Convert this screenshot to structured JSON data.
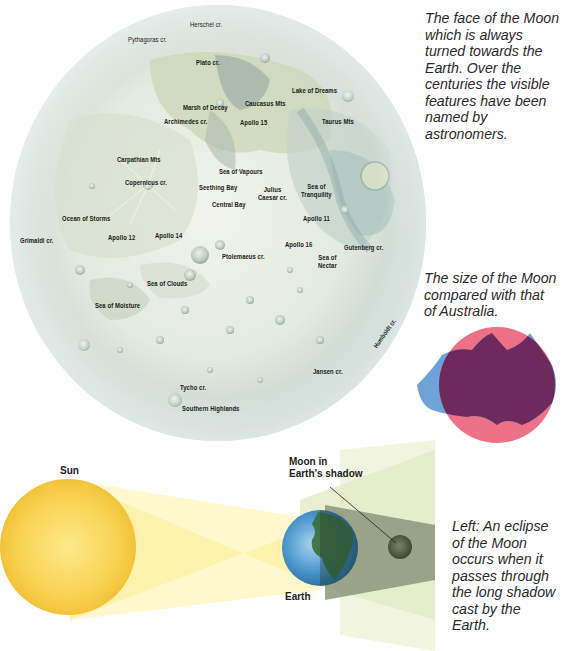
{
  "moon_map": {
    "labels": [
      {
        "id": "herschel",
        "text": "Herschel cr.",
        "x": 190,
        "y": 20
      },
      {
        "id": "pythagoras",
        "text": "Pythagoras cr.",
        "x": 128,
        "y": 35
      },
      {
        "id": "plato",
        "text": "Plato cr.",
        "x": 196,
        "y": 58
      },
      {
        "id": "lake-of-dreams",
        "text": "Lake of Dreams",
        "x": 292,
        "y": 86
      },
      {
        "id": "marsh-of-decay",
        "text": "Marsh of Decay",
        "x": 183,
        "y": 103
      },
      {
        "id": "caucasus-mts",
        "text": "Caucasus Mts",
        "x": 245,
        "y": 99
      },
      {
        "id": "archimedes",
        "text": "Archimedes cr.",
        "x": 164,
        "y": 117
      },
      {
        "id": "apollo-15",
        "text": "Apollo 15",
        "x": 240,
        "y": 118
      },
      {
        "id": "taurus-mts",
        "text": "Taurus Mts",
        "x": 322,
        "y": 117
      },
      {
        "id": "carpathian-mts",
        "text": "Carpathian Mts",
        "x": 117,
        "y": 155
      },
      {
        "id": "sea-of-vapours",
        "text": "Sea of Vapours",
        "x": 219,
        "y": 167
      },
      {
        "id": "copernicus",
        "text": "Copernicus cr.",
        "x": 125,
        "y": 178
      },
      {
        "id": "seething-bay",
        "text": "Seething Bay",
        "x": 199,
        "y": 183
      },
      {
        "id": "julius-caesar",
        "text": "Julius\nCaesar cr.",
        "x": 258,
        "y": 186
      },
      {
        "id": "sea-of-tranquility",
        "text": "Sea of\nTranquility",
        "x": 301,
        "y": 183
      },
      {
        "id": "central-bay",
        "text": "Central Bay",
        "x": 212,
        "y": 200
      },
      {
        "id": "ocean-of-storms",
        "text": "Ocean of Storms",
        "x": 62,
        "y": 214
      },
      {
        "id": "apollo-11",
        "text": "Apollo 11",
        "x": 303,
        "y": 214
      },
      {
        "id": "grimaldi",
        "text": "Grimaldi cr.",
        "x": 20,
        "y": 236
      },
      {
        "id": "apollo-12",
        "text": "Apollo 12",
        "x": 108,
        "y": 233
      },
      {
        "id": "apollo-14",
        "text": "Apollo 14",
        "x": 155,
        "y": 231
      },
      {
        "id": "apollo-16",
        "text": "Apollo 16",
        "x": 285,
        "y": 240
      },
      {
        "id": "gutenberg",
        "text": "Gutenberg cr.",
        "x": 344,
        "y": 243
      },
      {
        "id": "ptolemaeus",
        "text": "Ptolemaeus cr.",
        "x": 222,
        "y": 252
      },
      {
        "id": "sea-of-nectar",
        "text": "Sea of\nNectar",
        "x": 318,
        "y": 254
      },
      {
        "id": "sea-of-clouds",
        "text": "Sea of Clouds",
        "x": 147,
        "y": 279
      },
      {
        "id": "sea-of-moisture",
        "text": "Sea of Moisture",
        "x": 95,
        "y": 301
      },
      {
        "id": "jansen",
        "text": "Jansen cr.",
        "x": 313,
        "y": 367
      },
      {
        "id": "tycho",
        "text": "Tycho cr.",
        "x": 180,
        "y": 383
      },
      {
        "id": "southern-highlands",
        "text": "Southern Highlands",
        "x": 182,
        "y": 404
      }
    ],
    "humboldt_label": "Humboldt cr."
  },
  "captions": {
    "moon_face": "The face of the Moon\nwhich is always\nturned towards the\nEarth. Over the\ncenturies the visible\nfeatures have been\nnamed by\nastronomers.",
    "size_compare": "The size of the Moon\ncompared with that\nof Australia.",
    "eclipse": "Left: An eclipse\nof the Moon\noccurs when it\npasses through\nthe long shadow\ncast by the\nEarth."
  },
  "eclipse_diagram": {
    "sun_label": "Sun",
    "earth_label": "Earth",
    "moon_label": "Moon in\nEarth’s shadow"
  },
  "colors": {
    "sun": "#f5c842",
    "beam": "#fff09a",
    "shadow": "#7f8a70",
    "earth_ocean": "#3d8cc4",
    "earth_land": "#3c6b3a",
    "moon_disc_pink": "#ec7186",
    "australia_blue": "#6fa3d8",
    "overlap_purple": "#6e2a5c",
    "moon_surface": "#e6ece4",
    "maria": "#c8d4b8"
  }
}
